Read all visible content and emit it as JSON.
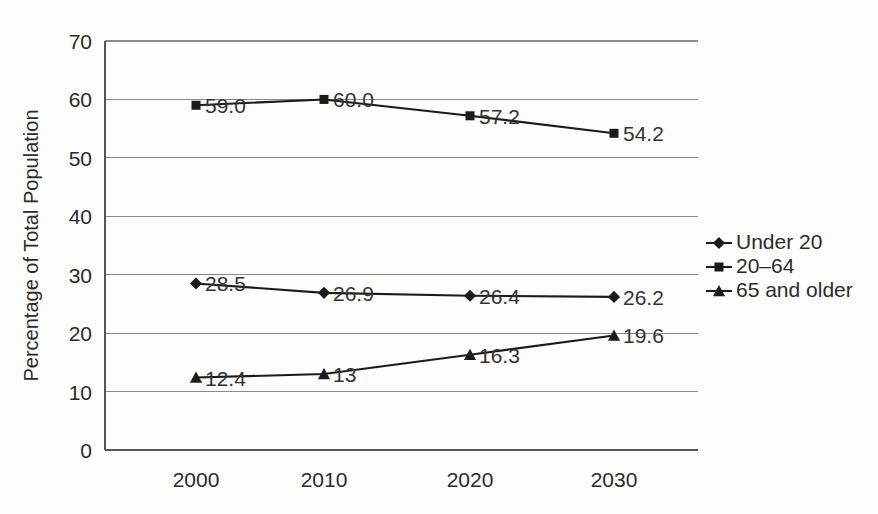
{
  "chart_data": {
    "type": "line",
    "title": "",
    "xlabel": "",
    "ylabel": "Percentage of Total Population",
    "categories": [
      "2000",
      "2010",
      "2020",
      "2030"
    ],
    "x": [
      2000,
      2010,
      2020,
      2030
    ],
    "ylim": [
      0,
      70
    ],
    "yticks": [
      "0",
      "10",
      "20",
      "30",
      "40",
      "50",
      "60",
      "70"
    ],
    "ytick_values": [
      0,
      10,
      20,
      30,
      40,
      50,
      60,
      70
    ],
    "grid": "horizontal",
    "legend_position": "right",
    "series": [
      {
        "name": "Under 20",
        "marker": "diamond",
        "values": [
          28.5,
          26.9,
          26.4,
          26.2
        ],
        "labels": [
          "28.5",
          "26.9",
          "26.4",
          "26.2"
        ]
      },
      {
        "name": "20–64",
        "marker": "square",
        "values": [
          59.0,
          60.0,
          57.2,
          54.2
        ],
        "labels": [
          "59.0",
          "60.0",
          "57.2",
          "54.2"
        ]
      },
      {
        "name": "65 and older",
        "marker": "triangle",
        "values": [
          12.4,
          13.0,
          16.3,
          19.6
        ],
        "labels": [
          "12.4",
          "13",
          "16.3",
          "19.6"
        ]
      }
    ],
    "colors": {
      "line": "#1b1b1b",
      "grid": "#8a8a8a",
      "axis": "#555555",
      "text": "#2b2b2b",
      "background": "#fdfdfc"
    }
  }
}
